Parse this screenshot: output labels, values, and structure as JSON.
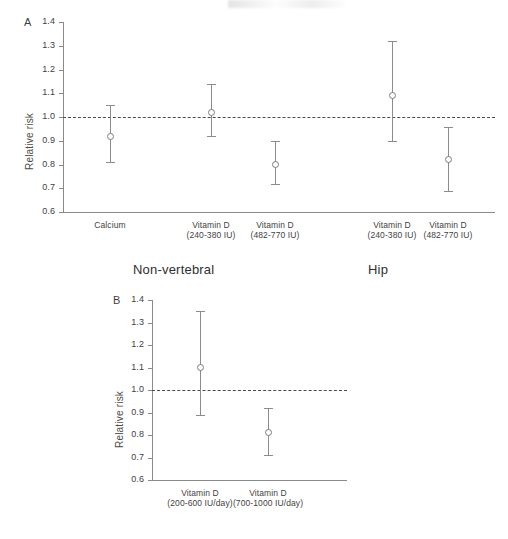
{
  "figure": {
    "background": "#ffffff",
    "marker_color": "#7d7d7d",
    "axis_color": "#8a8a8a",
    "ref_line_color": "#4b4b4b",
    "group_titles": [
      {
        "label": "Non-vertebral"
      },
      {
        "label": "Hip"
      }
    ]
  },
  "chart_data": [
    {
      "type": "scatter",
      "panel": "A",
      "panel_label": "A",
      "title": "",
      "xlabel": "",
      "ylabel": "Relative risk",
      "ylim": [
        0.6,
        1.4
      ],
      "yticks": [
        "0.6",
        "0.7",
        "0.8",
        "0.9",
        "1.0",
        "1.1",
        "1.2",
        "1.3",
        "1.4"
      ],
      "ytick_values": [
        0.6,
        0.7,
        0.8,
        0.9,
        1.0,
        1.1,
        1.2,
        1.3,
        1.4
      ],
      "grid": false,
      "legend": "none",
      "reference_line": 1.0,
      "error_bars": "95% CI",
      "groups": [
        "Non-vertebral",
        "Hip"
      ],
      "categories": [
        "Calcium",
        "Vitamin D (240-380 IU)",
        "Vitamin D (482-770 IU)",
        "Vitamin D (240-380 IU)",
        "Vitamin D (482-770 IU)"
      ],
      "category_labels": [
        {
          "line1": "Calcium",
          "line2": ""
        },
        {
          "line1": "Vitamin D",
          "line2": "(240-380 IU)"
        },
        {
          "line1": "Vitamin D",
          "line2": "(482-770 IU)"
        },
        {
          "line1": "Vitamin D",
          "line2": "(240-380 IU)"
        },
        {
          "line1": "Vitamin D",
          "line2": "(482-770 IU)"
        }
      ],
      "points": [
        {
          "category": "Calcium",
          "group": "Non-vertebral",
          "value": 0.92,
          "low": 0.81,
          "high": 1.05
        },
        {
          "category": "Vitamin D (240-380 IU)",
          "group": "Non-vertebral",
          "value": 1.02,
          "low": 0.92,
          "high": 1.14
        },
        {
          "category": "Vitamin D (482-770 IU)",
          "group": "Non-vertebral",
          "value": 0.8,
          "low": 0.72,
          "high": 0.9
        },
        {
          "category": "Vitamin D (240-380 IU)",
          "group": "Hip",
          "value": 1.09,
          "low": 0.9,
          "high": 1.32
        },
        {
          "category": "Vitamin D (482-770 IU)",
          "group": "Hip",
          "value": 0.82,
          "low": 0.69,
          "high": 0.96
        }
      ]
    },
    {
      "type": "scatter",
      "panel": "B",
      "panel_label": "B",
      "title": "",
      "xlabel": "",
      "ylabel": "Relative risk",
      "ylim": [
        0.6,
        1.4
      ],
      "yticks": [
        "0.6",
        "0.7",
        "0.8",
        "0.9",
        "1.0",
        "1.1",
        "1.2",
        "1.3",
        "1.4"
      ],
      "ytick_values": [
        0.6,
        0.7,
        0.8,
        0.9,
        1.0,
        1.1,
        1.2,
        1.3,
        1.4
      ],
      "grid": false,
      "legend": "none",
      "reference_line": 1.0,
      "error_bars": "95% CI",
      "categories": [
        "Vitamin D (200-600 IU/day)",
        "Vitamin D (700-1000 IU/day)"
      ],
      "category_labels": [
        {
          "line1": "Vitamin D",
          "line2": "(200-600 IU/day)"
        },
        {
          "line1": "Vitamin D",
          "line2": "(700-1000 IU/day)"
        }
      ],
      "points": [
        {
          "category": "Vitamin D (200-600 IU/day)",
          "value": 1.1,
          "low": 0.89,
          "high": 1.35
        },
        {
          "category": "Vitamin D (700-1000 IU/day)",
          "value": 0.81,
          "low": 0.71,
          "high": 0.92
        }
      ]
    }
  ]
}
